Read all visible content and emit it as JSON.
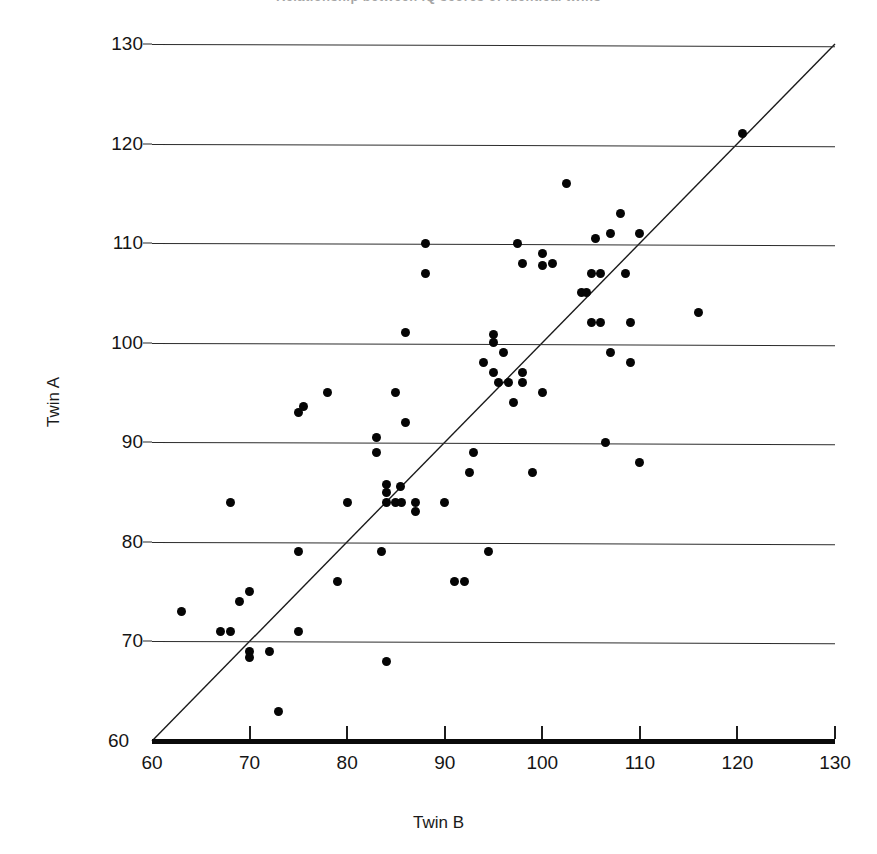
{
  "figure": {
    "title_cropped": "Relationship between IQ scores of identical twins",
    "background_color": "#ffffff",
    "dot_color": "#050505",
    "grid_color": "#2c2c2c"
  },
  "chart_data": {
    "type": "scatter",
    "title": "",
    "xlabel": "Twin B",
    "ylabel": "Twin A",
    "xlim": [
      60,
      130
    ],
    "ylim": [
      60,
      130
    ],
    "xticks": [
      60,
      70,
      80,
      90,
      100,
      110,
      120,
      130
    ],
    "yticks": [
      60,
      70,
      80,
      90,
      100,
      110,
      120,
      130
    ],
    "grid": "horizontal",
    "legend": "none",
    "reference_line": {
      "name": "identity-line",
      "equation": "y = x",
      "from": [
        60,
        60
      ],
      "to": [
        130,
        130
      ]
    },
    "points": [
      [
        63,
        73
      ],
      [
        67,
        71
      ],
      [
        68,
        71
      ],
      [
        68,
        84
      ],
      [
        69,
        74
      ],
      [
        70,
        75
      ],
      [
        70,
        69
      ],
      [
        70,
        68.4
      ],
      [
        72,
        69
      ],
      [
        73,
        63
      ],
      [
        75,
        79
      ],
      [
        75,
        71
      ],
      [
        75,
        93
      ],
      [
        75.5,
        93.6
      ],
      [
        78,
        95
      ],
      [
        79,
        76
      ],
      [
        80,
        84
      ],
      [
        83,
        89
      ],
      [
        83,
        90.5
      ],
      [
        83.5,
        79
      ],
      [
        84,
        68
      ],
      [
        84,
        85
      ],
      [
        84,
        85.8
      ],
      [
        84,
        84
      ],
      [
        85,
        84
      ],
      [
        85,
        95
      ],
      [
        85.5,
        85.6
      ],
      [
        85.6,
        84
      ],
      [
        86,
        92
      ],
      [
        86,
        101
      ],
      [
        87,
        84
      ],
      [
        87,
        83
      ],
      [
        88,
        110
      ],
      [
        88,
        107
      ],
      [
        90,
        84
      ],
      [
        91,
        76
      ],
      [
        92,
        76
      ],
      [
        92.5,
        87
      ],
      [
        93,
        89
      ],
      [
        94,
        98
      ],
      [
        94.5,
        79
      ],
      [
        95,
        100
      ],
      [
        95,
        100.8
      ],
      [
        95,
        97
      ],
      [
        95.5,
        96
      ],
      [
        96,
        99
      ],
      [
        96.5,
        96
      ],
      [
        97,
        94
      ],
      [
        97.5,
        110
      ],
      [
        98,
        97
      ],
      [
        98,
        96
      ],
      [
        98,
        108
      ],
      [
        99,
        87
      ],
      [
        100,
        95
      ],
      [
        100,
        109
      ],
      [
        100,
        107.8
      ],
      [
        101,
        108
      ],
      [
        102.5,
        116
      ],
      [
        104,
        105
      ],
      [
        104.5,
        105
      ],
      [
        105,
        107
      ],
      [
        105,
        102
      ],
      [
        105.5,
        110.5
      ],
      [
        106,
        107
      ],
      [
        106,
        102
      ],
      [
        106.5,
        90
      ],
      [
        107,
        111
      ],
      [
        107,
        99
      ],
      [
        108,
        113
      ],
      [
        108.5,
        107
      ],
      [
        109,
        98
      ],
      [
        109,
        102
      ],
      [
        110,
        111
      ],
      [
        110,
        88
      ],
      [
        116,
        103
      ],
      [
        120.5,
        121
      ]
    ]
  },
  "axes": {
    "y_title": "Twin A",
    "x_title": "Twin B",
    "y_origin_label": "60",
    "x_tick_labels": [
      "60",
      "70",
      "80",
      "90",
      "100",
      "110",
      "120",
      "130"
    ],
    "y_tick_labels": [
      "130",
      "120",
      "110",
      "100",
      "90",
      "80",
      "70",
      "60"
    ]
  }
}
